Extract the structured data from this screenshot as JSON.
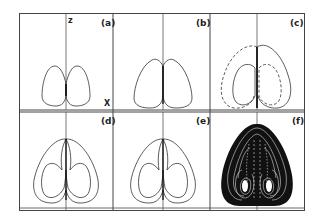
{
  "figure": {
    "panels": [
      {
        "id": "a",
        "label": "(a)",
        "description": "two symmetric single loops"
      },
      {
        "id": "b",
        "label": "(b)",
        "description": "two symmetric single loops, larger"
      },
      {
        "id": "c",
        "label": "(c)",
        "description": "solid and dashed asymmetric orbits"
      },
      {
        "id": "d",
        "label": "(d)",
        "description": "double-loop periodic orbit"
      },
      {
        "id": "e",
        "label": "(e)",
        "description": "double-loop periodic orbit"
      },
      {
        "id": "f",
        "label": "(f)",
        "description": "chaotic strange attractor"
      }
    ],
    "axes": {
      "vertical": "z",
      "horizontal": "X"
    },
    "colors": {
      "line": "#333333",
      "frame": "#444444",
      "fill": "#111111"
    }
  }
}
